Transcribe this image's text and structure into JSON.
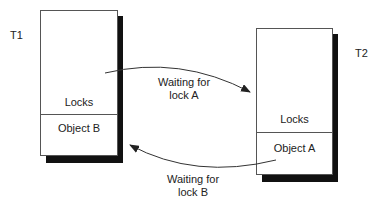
{
  "transactions": [
    {
      "name": "T1",
      "locks_label": "Locks",
      "object_label": "Object B"
    },
    {
      "name": "T2",
      "locks_label": "Locks",
      "object_label": "Object A"
    }
  ],
  "edges": [
    {
      "from": "T1",
      "to": "T2",
      "label_line1": "Waiting for",
      "label_line2": "lock A"
    },
    {
      "from": "T2",
      "to": "T1",
      "label_line1": "Waiting for",
      "label_line2": "lock B"
    }
  ],
  "colors": {
    "shadow": "#111111",
    "border": "#555555",
    "arrow": "#333333"
  }
}
